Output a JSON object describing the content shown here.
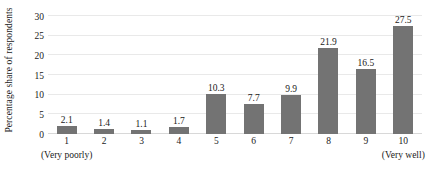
{
  "chart_data": {
    "type": "bar",
    "title": "",
    "subtitle": "",
    "xlabel": "",
    "ylabel": "Percentage share of respondents",
    "categories": [
      "1",
      "2",
      "3",
      "4",
      "5",
      "6",
      "7",
      "8",
      "9",
      "10"
    ],
    "values": [
      2.1,
      1.4,
      1.1,
      1.7,
      10.3,
      7.7,
      9.9,
      21.9,
      16.5,
      27.5
    ],
    "value_labels": [
      "2.1",
      "1.4",
      "1.1",
      "1.7",
      "10.3",
      "7.7",
      "9.9",
      "21.9",
      "16.5",
      "27.5"
    ],
    "ylim": [
      0,
      30
    ],
    "yticks": [
      0,
      5,
      10,
      15,
      20,
      25,
      30
    ],
    "ytick_labels": [
      "0",
      "5",
      "10",
      "15",
      "20",
      "25",
      "30"
    ],
    "grid": true,
    "grid_axis": "y",
    "legend": false,
    "legend_position": "none",
    "series": [
      {
        "name": "Percentage share of respondents",
        "values": [
          2.1,
          1.4,
          1.1,
          1.7,
          10.3,
          7.7,
          9.9,
          21.9,
          16.5,
          27.5
        ]
      }
    ],
    "annotations": [
      {
        "text": "(Very poorly)",
        "anchor_category": "1"
      },
      {
        "text": "(Very well)",
        "anchor_category": "10"
      }
    ],
    "colors": {
      "bar": "#737373",
      "gridline": "#e9e9e9",
      "baseline": "#d8d8d8",
      "text": "#1a1a1a",
      "background": "#ffffff"
    }
  }
}
